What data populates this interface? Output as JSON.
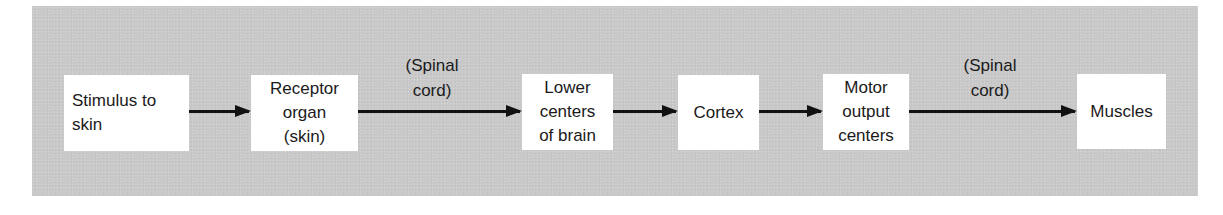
{
  "diagram": {
    "type": "flowchart",
    "direction": "left-to-right",
    "colors": {
      "panel_background": "#c9c9c9",
      "box_fill": "#ffffff",
      "arrow": "#111111",
      "text": "#1a1a1a"
    },
    "nodes": [
      {
        "id": "stimulus",
        "lines": [
          "Stimulus to",
          "skin"
        ]
      },
      {
        "id": "receptor",
        "lines": [
          "Receptor",
          "organ",
          "(skin)"
        ]
      },
      {
        "id": "lower-centers",
        "lines": [
          "Lower",
          "centers",
          "of brain"
        ]
      },
      {
        "id": "cortex",
        "lines": [
          "Cortex"
        ]
      },
      {
        "id": "motor-output",
        "lines": [
          "Motor",
          "output",
          "centers"
        ]
      },
      {
        "id": "muscles",
        "lines": [
          "Muscles"
        ]
      }
    ],
    "edges": [
      {
        "from": "stimulus",
        "to": "receptor",
        "label_lines": []
      },
      {
        "from": "receptor",
        "to": "lower-centers",
        "label_lines": [
          "(Spinal",
          "cord)"
        ]
      },
      {
        "from": "lower-centers",
        "to": "cortex",
        "label_lines": []
      },
      {
        "from": "cortex",
        "to": "motor-output",
        "label_lines": []
      },
      {
        "from": "motor-output",
        "to": "muscles",
        "label_lines": [
          "(Spinal",
          "cord)"
        ]
      }
    ]
  }
}
